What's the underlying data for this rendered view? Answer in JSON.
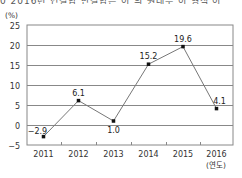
{
  "header": {
    "cropped_text": "0 2016년 연결합 반결합은 이 의 원래부 이 형식 이"
  },
  "chart_data": {
    "type": "line",
    "title": "",
    "ylabel": "(%)",
    "xlabel": "(연도)",
    "categories": [
      "2011",
      "2012",
      "2013",
      "2014",
      "2015",
      "2016"
    ],
    "values": [
      -2.9,
      6.1,
      1.0,
      15.2,
      19.6,
      4.1
    ],
    "data_labels": [
      "−2.9",
      "6.1",
      "1.0",
      "15.2",
      "19.6",
      "4.1"
    ],
    "ylim": [
      -5,
      25
    ],
    "yticks": [
      25,
      20,
      15,
      10,
      5,
      0,
      -5
    ],
    "ytick_labels": [
      "25",
      "20",
      "15",
      "10",
      "5",
      "0",
      "−5"
    ],
    "grid": true,
    "legend": null
  },
  "colors": {
    "line": "#777777",
    "marker": "#111111",
    "grid": "#888888",
    "frame": "#888888",
    "text": "#333333"
  }
}
